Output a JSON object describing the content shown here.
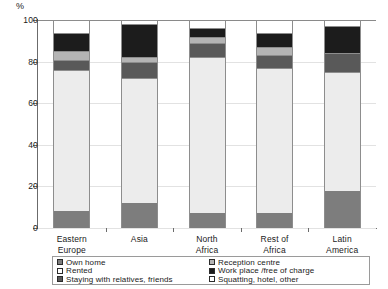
{
  "chart_data": {
    "type": "bar",
    "subtype": "stacked-bar-percent",
    "title": "",
    "xlabel": "",
    "ylabel": "%",
    "ylim": [
      0,
      100
    ],
    "yticks": [
      0,
      20,
      40,
      60,
      80,
      100
    ],
    "grid": true,
    "legend_position": "bottom",
    "categories": [
      "Eastern Europe",
      "Asia",
      "North Africa",
      "Rest of Africa",
      "Latin America"
    ],
    "category_lines": [
      [
        "Eastern",
        "Europe"
      ],
      [
        "Asia",
        ""
      ],
      [
        "North",
        "Africa"
      ],
      [
        "Rest of",
        "Africa"
      ],
      [
        "Latin",
        "America"
      ]
    ],
    "series": [
      {
        "name": "Own home",
        "color": "#7d7d7d",
        "values": [
          8,
          12,
          7,
          7,
          18
        ]
      },
      {
        "name": "Rented",
        "color": "#ececec",
        "values": [
          68,
          60,
          75,
          70,
          57
        ]
      },
      {
        "name": "Staying with relatives, friends",
        "color": "#595959",
        "values": [
          5,
          8,
          7,
          6,
          9
        ]
      },
      {
        "name": "Reception centre",
        "color": "#b4b4b4",
        "values": [
          4,
          2,
          3,
          4,
          0
        ]
      },
      {
        "name": "Work place /free of charge",
        "color": "#1c1c1c",
        "values": [
          9,
          16,
          4,
          7,
          13
        ]
      },
      {
        "name": "Squatting, hotel, other",
        "color": "#ffffff",
        "values": [
          6,
          2,
          4,
          6,
          3
        ]
      }
    ]
  },
  "axis": {
    "y_unit": "%",
    "tick_labels": [
      "0",
      "20",
      "40",
      "60",
      "80",
      "100"
    ]
  },
  "legend": {
    "entries": [
      {
        "label": "Own home",
        "color": "#7d7d7d"
      },
      {
        "label": "Reception centre",
        "color": "#b4b4b4"
      },
      {
        "label": "Rented",
        "color": "#ffffff"
      },
      {
        "label": "Work place /free of charge",
        "color": "#1c1c1c"
      },
      {
        "label": "Staying with relatives, friends",
        "color": "#595959"
      },
      {
        "label": "Squatting, hotel, other",
        "color": "#ffffff"
      }
    ]
  }
}
